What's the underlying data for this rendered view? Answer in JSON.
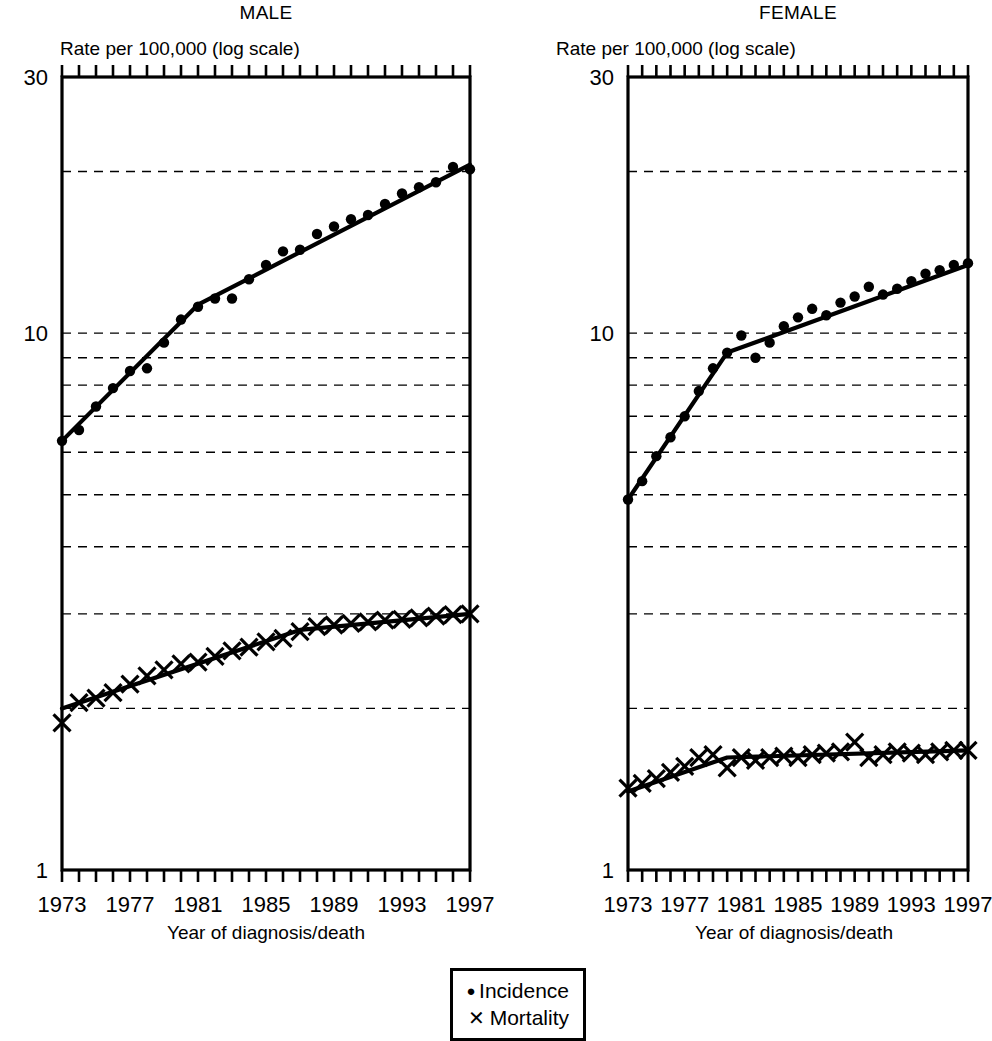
{
  "figure": {
    "legend": {
      "entries": [
        {
          "symbol": "dot-marker",
          "glyph": "●",
          "label": "Incidence"
        },
        {
          "symbol": "cross-marker",
          "glyph": "✕",
          "label": "Mortality"
        }
      ]
    }
  },
  "chart_data": [
    {
      "type": "scatter",
      "title": "MALE",
      "ylabel": "Rate per 100,000 (log scale)",
      "xlabel": "Year of diagnosis/death",
      "yscale": "log",
      "ylim": [
        1,
        30
      ],
      "ytick_labels": [
        "30",
        "10",
        "1"
      ],
      "yticks": [
        30,
        10,
        1
      ],
      "gridlines": [
        20,
        10,
        9,
        8,
        7,
        6,
        5,
        4,
        3,
        2
      ],
      "grid": true,
      "xlim": [
        1973,
        1997
      ],
      "xtick_labels": [
        "1973",
        "1977",
        "1981",
        "1985",
        "1989",
        "1993",
        "1997"
      ],
      "xticks": [
        1973,
        1977,
        1981,
        1985,
        1989,
        1993,
        1997
      ],
      "x": [
        1973,
        1974,
        1975,
        1976,
        1977,
        1978,
        1979,
        1980,
        1981,
        1982,
        1983,
        1984,
        1985,
        1986,
        1987,
        1988,
        1989,
        1990,
        1991,
        1992,
        1993,
        1994,
        1995,
        1996,
        1997
      ],
      "series": [
        {
          "name": "Incidence",
          "marker": "dot",
          "values": [
            6.3,
            6.6,
            7.3,
            7.9,
            8.5,
            8.6,
            9.6,
            10.6,
            11.2,
            11.6,
            11.6,
            12.6,
            13.4,
            14.2,
            14.3,
            15.3,
            15.8,
            16.3,
            16.6,
            17.4,
            18.2,
            18.7,
            19.1,
            20.4,
            20.2
          ],
          "fit": {
            "joinpoints": [
              1973,
              1981,
              1997
            ],
            "fit_values": [
              6.3,
              11.3,
              20.6
            ]
          }
        },
        {
          "name": "Mortality",
          "marker": "cross",
          "values": [
            1.88,
            2.05,
            2.09,
            2.14,
            2.22,
            2.3,
            2.36,
            2.42,
            2.44,
            2.5,
            2.56,
            2.6,
            2.66,
            2.7,
            2.78,
            2.84,
            2.86,
            2.88,
            2.9,
            2.92,
            2.93,
            2.95,
            2.97,
            2.99,
            3.0
          ],
          "fit": {
            "joinpoints": [
              1973,
              1987,
              1997
            ],
            "fit_values": [
              2.0,
              2.8,
              3.0
            ]
          }
        }
      ]
    },
    {
      "type": "scatter",
      "title": "FEMALE",
      "ylabel": "Rate per 100,000 (log scale)",
      "xlabel": "Year of diagnosis/death",
      "yscale": "log",
      "ylim": [
        1,
        30
      ],
      "ytick_labels": [
        "30",
        "10",
        "1"
      ],
      "yticks": [
        30,
        10,
        1
      ],
      "gridlines": [
        20,
        10,
        9,
        8,
        7,
        6,
        5,
        4,
        3,
        2
      ],
      "grid": true,
      "xlim": [
        1973,
        1997
      ],
      "xtick_labels": [
        "1973",
        "1977",
        "1981",
        "1985",
        "1989",
        "1993",
        "1997"
      ],
      "xticks": [
        1973,
        1977,
        1981,
        1985,
        1989,
        1993,
        1997
      ],
      "x": [
        1973,
        1974,
        1975,
        1976,
        1977,
        1978,
        1979,
        1980,
        1981,
        1982,
        1983,
        1984,
        1985,
        1986,
        1987,
        1988,
        1989,
        1990,
        1991,
        1992,
        1993,
        1994,
        1995,
        1996,
        1997
      ],
      "series": [
        {
          "name": "Incidence",
          "marker": "dot",
          "values": [
            4.9,
            5.3,
            5.9,
            6.4,
            7.0,
            7.8,
            8.6,
            9.2,
            9.9,
            9.0,
            9.6,
            10.3,
            10.7,
            11.1,
            10.8,
            11.4,
            11.7,
            12.2,
            11.8,
            12.1,
            12.5,
            12.9,
            13.1,
            13.4,
            13.5
          ],
          "fit": {
            "joinpoints": [
              1973,
              1980,
              1997
            ],
            "fit_values": [
              4.9,
              9.2,
              13.4
            ]
          }
        },
        {
          "name": "Mortality",
          "marker": "cross",
          "values": [
            1.42,
            1.45,
            1.48,
            1.52,
            1.56,
            1.62,
            1.64,
            1.55,
            1.62,
            1.6,
            1.62,
            1.63,
            1.62,
            1.64,
            1.65,
            1.66,
            1.73,
            1.62,
            1.64,
            1.66,
            1.65,
            1.64,
            1.66,
            1.67,
            1.67
          ],
          "fit": {
            "joinpoints": [
              1973,
              1980,
              1997
            ],
            "fit_values": [
              1.4,
              1.62,
              1.67
            ]
          }
        }
      ]
    }
  ]
}
